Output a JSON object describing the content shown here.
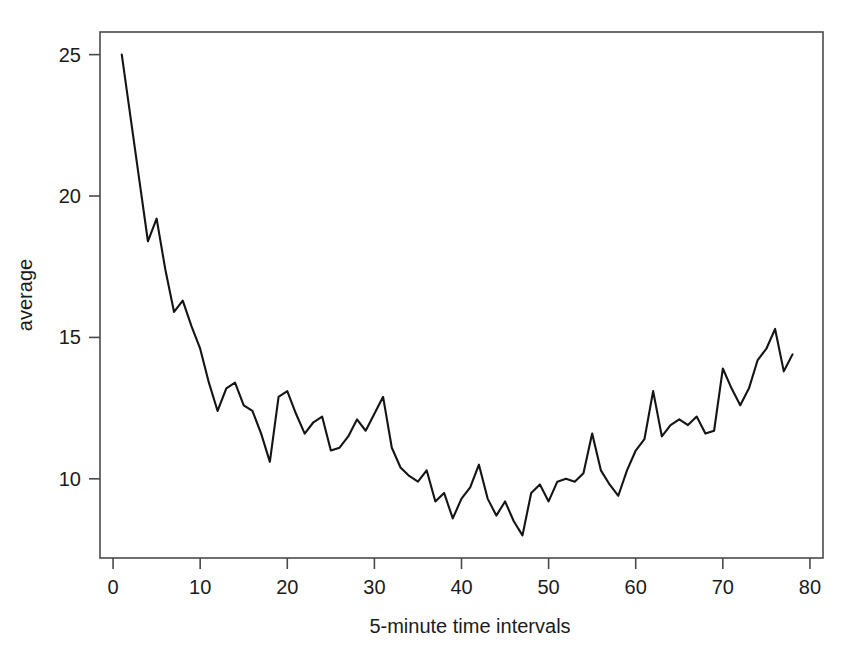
{
  "chart_data": {
    "type": "line",
    "title": "",
    "xlabel": "5-minute time intervals",
    "ylabel": "average",
    "xlim": [
      -1.5,
      81.5
    ],
    "ylim": [
      7.2,
      25.8
    ],
    "grid": false,
    "legend": null,
    "xticks": [
      0,
      10,
      20,
      30,
      40,
      50,
      60,
      70,
      80
    ],
    "xtick_labels": [
      "0",
      "10",
      "20",
      "30",
      "40",
      "50",
      "60",
      "70",
      "80"
    ],
    "yticks": [
      10,
      15,
      20,
      25
    ],
    "ytick_labels": [
      "10",
      "15",
      "20",
      "25"
    ],
    "series": [
      {
        "name": "average",
        "color": "#141414",
        "x": [
          1,
          2,
          3,
          4,
          5,
          6,
          7,
          8,
          9,
          10,
          11,
          12,
          13,
          14,
          15,
          16,
          17,
          18,
          19,
          20,
          21,
          22,
          23,
          24,
          25,
          26,
          27,
          28,
          29,
          30,
          31,
          32,
          33,
          34,
          35,
          36,
          37,
          38,
          39,
          40,
          41,
          42,
          43,
          44,
          45,
          46,
          47,
          48,
          49,
          50,
          51,
          52,
          53,
          54,
          55,
          56,
          57,
          58,
          59,
          60,
          61,
          62,
          63,
          64,
          65,
          66,
          67,
          68,
          69,
          70,
          71,
          72,
          73,
          74,
          75,
          76,
          77,
          78
        ],
        "values": [
          25.0,
          22.8,
          20.6,
          18.4,
          19.2,
          17.4,
          15.9,
          16.3,
          15.4,
          14.6,
          13.4,
          12.4,
          13.2,
          13.4,
          12.6,
          12.4,
          11.6,
          10.6,
          12.9,
          13.1,
          12.3,
          11.6,
          12.0,
          12.2,
          11.0,
          11.1,
          11.5,
          12.1,
          11.7,
          12.3,
          12.9,
          11.1,
          10.4,
          10.1,
          9.9,
          10.3,
          9.2,
          9.5,
          8.6,
          9.3,
          9.7,
          10.5,
          9.3,
          8.7,
          9.2,
          8.5,
          8.0,
          9.5,
          9.8,
          9.2,
          9.9,
          10.0,
          9.9,
          10.2,
          11.6,
          10.3,
          9.8,
          9.4,
          10.3,
          11.0,
          11.4,
          13.1,
          11.5,
          11.9,
          12.1,
          11.9,
          12.2,
          11.6,
          11.7,
          13.9,
          13.2,
          12.6,
          13.2,
          14.2,
          14.6,
          15.3,
          13.8,
          14.4
        ]
      }
    ]
  },
  "figure": {
    "background_color": "#ffffff",
    "frame_color": "#4a4a4a",
    "line_color": "#141414"
  }
}
